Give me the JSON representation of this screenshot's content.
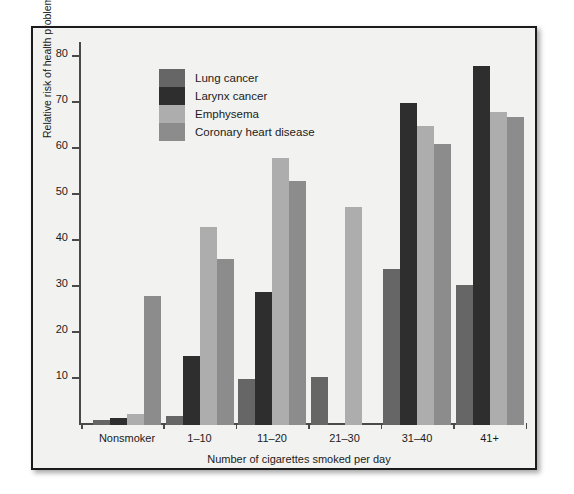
{
  "chart_data": {
    "type": "bar",
    "title": "",
    "xlabel": "Number of cigarettes smoked per day",
    "ylabel": "Relative risk of health problem",
    "categories": [
      "Nonsmoker",
      "1–10",
      "11–20",
      "21–30",
      "31–40",
      "41+"
    ],
    "ylim": [
      0,
      80
    ],
    "yticks": [
      10,
      20,
      30,
      40,
      50,
      60,
      70,
      80
    ],
    "grid": false,
    "legend_position": "upper-left-inside",
    "series": [
      {
        "name": "Lung cancer",
        "color": "#666666",
        "values": [
          1,
          2,
          10,
          10.5,
          34,
          30.5
        ]
      },
      {
        "name": "Larynx cancer",
        "color": "#2e2e2e",
        "values": [
          1.5,
          15,
          29,
          null,
          70,
          78
        ]
      },
      {
        "name": "Emphysema",
        "color": "#adadad",
        "values": [
          2.5,
          43,
          58,
          47.5,
          65,
          68
        ]
      },
      {
        "name": "Coronary heart disease",
        "color": "#8c8c8c",
        "values": [
          28,
          36,
          53,
          null,
          61,
          67
        ]
      }
    ]
  },
  "axis": {
    "y_title": "Relative risk of health problem",
    "x_title": "Number of cigarettes smoked per day",
    "y_tick_labels": [
      "80",
      "70",
      "60",
      "50",
      "40",
      "30",
      "20",
      "10"
    ],
    "x_tick_labels": [
      "Nonsmoker",
      "1–10",
      "11–20",
      "21–30",
      "31–40",
      "41+"
    ]
  },
  "legend": {
    "items": [
      {
        "label": "Lung cancer",
        "color": "#666666"
      },
      {
        "label": "Larynx cancer",
        "color": "#2e2e2e"
      },
      {
        "label": "Emphysema",
        "color": "#adadad"
      },
      {
        "label": "Coronary heart disease",
        "color": "#8c8c8c"
      }
    ]
  }
}
